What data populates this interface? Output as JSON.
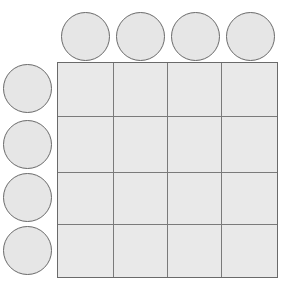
{
  "diagram": {
    "type": "grid-with-header-circles",
    "rows": 4,
    "columns": 4,
    "column_headers": [
      "",
      "",
      "",
      ""
    ],
    "row_headers": [
      "",
      "",
      "",
      ""
    ],
    "cells": [
      [
        "",
        "",
        "",
        ""
      ],
      [
        "",
        "",
        "",
        ""
      ],
      [
        "",
        "",
        "",
        ""
      ],
      [
        "",
        "",
        "",
        ""
      ]
    ],
    "colors": {
      "fill": "#e8e8e8",
      "stroke": "#6a6a6a",
      "background": "#ffffff"
    }
  }
}
